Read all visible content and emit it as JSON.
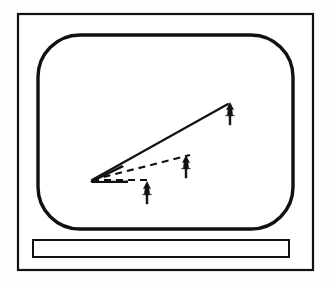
{
  "figure": {
    "background_color": "#fefefe",
    "stroke_color": "#111111",
    "fill_color": "#ffffff"
  },
  "monitor": {
    "outer_case": {
      "label": "monitor outer case",
      "x": 18,
      "y": 14,
      "width": 295,
      "height": 256,
      "stroke_width": 2.2
    },
    "screen": {
      "label": "CRT screen bezel",
      "x": 38,
      "y": 35,
      "width": 255,
      "height": 194,
      "corner_radius": 42,
      "stroke_width": 3.4
    },
    "control_bar": {
      "label": "front control panel strip",
      "x": 33,
      "y": 240,
      "width": 256,
      "height": 17,
      "stroke_width": 2.0
    }
  },
  "diagram": {
    "origin": {
      "label": "common vertex",
      "x": 92,
      "y": 180
    },
    "vectors": [
      {
        "name": "primary-vector",
        "style": "solid",
        "stroke_width": 2.1,
        "from": {
          "x": 92,
          "y": 180
        },
        "to": {
          "x": 228,
          "y": 104
        },
        "marker": "up-arrow-glyph",
        "marker_position": {
          "x": 230,
          "y": 113
        }
      },
      {
        "name": "secondary-vector",
        "style": "dashed",
        "stroke_width": 2.1,
        "dash_pattern": "7 5",
        "from": {
          "x": 92,
          "y": 180
        },
        "to": {
          "x": 190,
          "y": 155
        },
        "marker": "up-arrow-glyph",
        "marker_position": {
          "x": 186,
          "y": 166
        }
      },
      {
        "name": "tertiary-vector",
        "style": "dashed",
        "stroke_width": 2.1,
        "dash_pattern": "7 5",
        "from": {
          "x": 92,
          "y": 180
        },
        "to": {
          "x": 152,
          "y": 180
        },
        "marker": "up-arrow-glyph",
        "marker_position": {
          "x": 147,
          "y": 192
        }
      }
    ],
    "arrow_markers": [
      {
        "name": "arrow-marker-primary",
        "x": 230,
        "y": 113,
        "scale": 1.0
      },
      {
        "name": "arrow-marker-secondary",
        "x": 186,
        "y": 166,
        "scale": 1.0
      },
      {
        "name": "arrow-marker-tertiary",
        "x": 147,
        "y": 192,
        "scale": 1.0
      }
    ]
  }
}
